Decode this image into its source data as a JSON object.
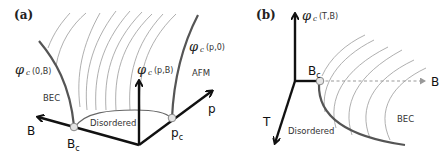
{
  "figure": {
    "panels": [
      {
        "id": "a",
        "label": "(a)",
        "axes": {
          "B": "B",
          "p": "p",
          "vertical": "(p,B)"
        },
        "critical_points": {
          "Bc_main": "B",
          "Bc_sub": "c",
          "pc_main": "p",
          "pc_sub": "c"
        },
        "phase_boundaries": {
          "left": "(0,B)",
          "right": "(p,0)"
        },
        "regions": {
          "bec": "BEC",
          "afm": "AFM",
          "disordered": "Disordered"
        },
        "phi_symbol": "φ",
        "phi_sub": "c"
      },
      {
        "id": "b",
        "label": "(b)",
        "axes": {
          "B": "B",
          "T": "T",
          "vertical": "(T,B)"
        },
        "critical_points": {
          "Bc_main": "B",
          "Bc_sub": "c"
        },
        "regions": {
          "bec": "BEC",
          "disordered": "Disordered"
        },
        "phi_symbol": "φ",
        "phi_sub": "c"
      }
    ]
  }
}
